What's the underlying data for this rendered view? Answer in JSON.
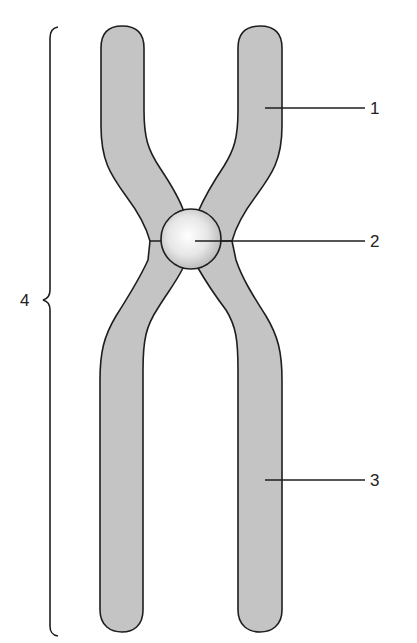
{
  "diagram": {
    "colors": {
      "chromatid_fill": "#c4c4c4",
      "outline": "#1e1e1e",
      "centromere_highlight": "#ffffff",
      "centromere_shadow": "#b4b4b4",
      "background": "#ffffff",
      "text": "#222222"
    },
    "labels": [
      {
        "id": "1",
        "text": "1",
        "points_to": "upper arm of chromatid"
      },
      {
        "id": "2",
        "text": "2",
        "points_to": "centromere"
      },
      {
        "id": "3",
        "text": "3",
        "points_to": "lower arm of chromatid"
      },
      {
        "id": "4",
        "text": "4",
        "points_to": "entire chromosome (brace)"
      }
    ]
  }
}
